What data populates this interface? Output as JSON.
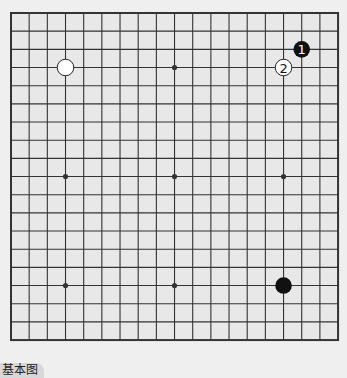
{
  "diagram": {
    "title": "基本图",
    "board_size": 19,
    "colors": {
      "background": "#e8e8e8",
      "line": "#333333",
      "black": "#111111",
      "white": "#ffffff"
    },
    "star_points": [
      [
        3,
        3
      ],
      [
        9,
        3
      ],
      [
        15,
        3
      ],
      [
        3,
        9
      ],
      [
        9,
        9
      ],
      [
        15,
        9
      ],
      [
        3,
        15
      ],
      [
        9,
        15
      ],
      [
        15,
        15
      ]
    ],
    "stones": [
      {
        "color": "white",
        "col": 3,
        "row": 3,
        "label": ""
      },
      {
        "color": "black",
        "col": 16,
        "row": 2,
        "label": "1"
      },
      {
        "color": "white",
        "col": 15,
        "row": 3,
        "label": "2"
      },
      {
        "color": "black",
        "col": 15,
        "row": 15,
        "label": ""
      }
    ]
  }
}
